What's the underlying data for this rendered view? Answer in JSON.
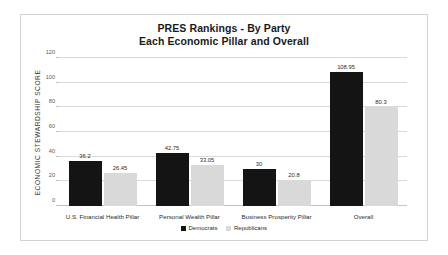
{
  "chart_data": {
    "type": "bar",
    "title": "PRES Rankings - By Party",
    "subtitle": "Each Economic Pillar and Overall",
    "xlabel": "",
    "ylabel": "ECONOMIC STEWARDSHIP SCORE",
    "ylim": [
      0,
      120
    ],
    "yticks": [
      "0",
      "20",
      "40",
      "60",
      "80",
      "100",
      "120"
    ],
    "grid": "horizontal",
    "legend_position": "bottom",
    "categories": [
      "U.S. Financial Health Pillar",
      "Personal Wealth Pillar",
      "Business Prosperity Pillar",
      "Overall"
    ],
    "series": [
      {
        "name": "Democrats",
        "color": "#141414",
        "values": [
          36.2,
          42.75,
          30,
          108.95
        ],
        "labels": [
          "36.2",
          "42.75",
          "30",
          "108.95"
        ]
      },
      {
        "name": "Republicans",
        "color": "#d9d9d9",
        "values": [
          26.45,
          33.05,
          20.8,
          80.3
        ],
        "labels": [
          "26.45",
          "33.05",
          "20.8",
          "80.3"
        ]
      }
    ]
  }
}
